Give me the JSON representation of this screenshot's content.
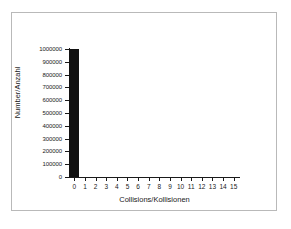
{
  "chart_data": {
    "type": "bar",
    "title": "",
    "subtitle": "",
    "xlabel": "Collisions/Kollisionen",
    "ylabel": "Number/Anzahl",
    "categories": [
      "0",
      "1",
      "2",
      "3",
      "4",
      "5",
      "6",
      "7",
      "8",
      "9",
      "10",
      "11",
      "12",
      "13",
      "14",
      "15"
    ],
    "values": [
      1000000,
      0,
      0,
      0,
      0,
      0,
      0,
      0,
      0,
      0,
      0,
      0,
      0,
      0,
      0,
      0
    ],
    "series": [
      {
        "name": "Number/Anzahl",
        "values": [
          1000000,
          0,
          0,
          0,
          0,
          0,
          0,
          0,
          0,
          0,
          0,
          0,
          0,
          0,
          0,
          0
        ]
      }
    ],
    "ylim": [
      0,
      1000000
    ],
    "xlim": [
      0,
      15
    ],
    "ytick_labels": [
      "0",
      "100000",
      "200000",
      "300000",
      "400000",
      "500000",
      "600000",
      "700000",
      "800000",
      "900000",
      "1000000"
    ],
    "ytick_values": [
      0,
      100000,
      200000,
      300000,
      400000,
      500000,
      600000,
      700000,
      800000,
      900000,
      1000000
    ],
    "xtick_labels": [
      "0",
      "1",
      "2",
      "3",
      "4",
      "5",
      "6",
      "7",
      "8",
      "9",
      "10",
      "11",
      "12",
      "13",
      "14",
      "15"
    ],
    "grid": false,
    "legend": false,
    "legend_position": "none",
    "bar_color": "#111111",
    "axis_color": "#1a1a1a",
    "background_color": "#ffffff",
    "frame_color": "#b9b9b9",
    "annotations": []
  }
}
